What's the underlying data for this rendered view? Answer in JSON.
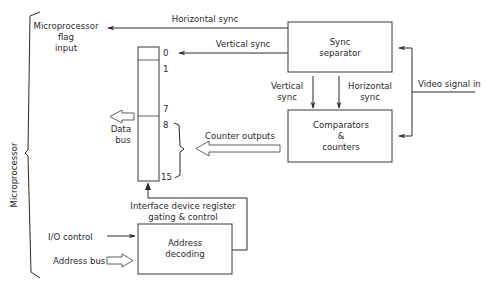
{
  "diagram": {
    "left_bracket_label": "Microprocessor",
    "flag_input": {
      "line1": "Microprocessor",
      "line2": "flag",
      "line3": "input"
    },
    "horizontal_sync_top": "Horizontal sync",
    "vertical_sync_top": "Vertical sync",
    "sync_separator": {
      "line1": "Sync",
      "line2": "separator"
    },
    "vertical_sync_down": {
      "line1": "Vertical",
      "line2": "sync"
    },
    "horizontal_sync_down": {
      "line1": "Horizontal",
      "line2": "sync"
    },
    "video_signal_in": "Video signal in",
    "comparators": {
      "line1": "Comparators",
      "line2": "&",
      "line3": "counters"
    },
    "counter_outputs": "Counter outputs",
    "data_bus": {
      "line1": "Data",
      "line2": "bus"
    },
    "register_bits": [
      "0",
      "1",
      "7",
      "8",
      "15"
    ],
    "interface_control": {
      "line1": "Interface device register",
      "line2": "gating & control"
    },
    "io_control": "I/O control",
    "address_bus": "Address bus",
    "address_decoding": {
      "line1": "Address",
      "line2": "decoding"
    }
  }
}
